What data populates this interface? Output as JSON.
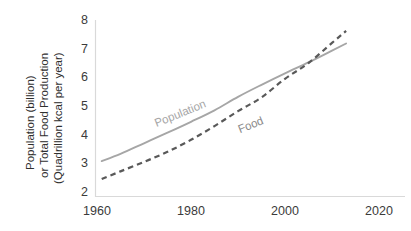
{
  "chart_data": {
    "type": "line",
    "title": "",
    "subtitle": "",
    "xlabel": "",
    "ylabel": "Population (billion) or Total Food Production (Quadrillion kcal per year)",
    "ylabel_lines": [
      "Population (billion)",
      "or Total Food Production",
      "(Quadrillion kcal per year)"
    ],
    "xlim": [
      1958,
      2024
    ],
    "ylim": [
      2,
      8
    ],
    "xticks": [
      1960,
      1980,
      2000,
      2020
    ],
    "yticks": [
      2,
      3,
      4,
      5,
      6,
      7,
      8
    ],
    "xtick_labels": [
      "1960",
      "1980",
      "2000",
      "2020"
    ],
    "ytick_labels": [
      "2",
      "3",
      "4",
      "5",
      "6",
      "7",
      "8"
    ],
    "grid": false,
    "legend_position": "inline-annotation",
    "series": [
      {
        "name": "Population",
        "label": "Population",
        "style": "solid",
        "color": "#a6a6a6",
        "x": [
          1961,
          1965,
          1970,
          1975,
          1980,
          1985,
          1990,
          1995,
          2000,
          2005,
          2010,
          2013
        ],
        "values": [
          3.08,
          3.33,
          3.7,
          4.07,
          4.45,
          4.85,
          5.32,
          5.74,
          6.14,
          6.52,
          6.93,
          7.18
        ]
      },
      {
        "name": "Food",
        "label": "Food",
        "style": "dashed",
        "color": "#595959",
        "x": [
          1961,
          1965,
          1970,
          1975,
          1980,
          1985,
          1990,
          1995,
          2000,
          2005,
          2010,
          2013
        ],
        "values": [
          2.45,
          2.72,
          3.05,
          3.4,
          3.82,
          4.3,
          4.82,
          5.3,
          5.95,
          6.5,
          7.2,
          7.62
        ]
      }
    ],
    "annotations": [
      {
        "text": "Population",
        "x": 1978,
        "y": 4.62,
        "rotation": -22,
        "color": "#a6a6a6"
      },
      {
        "text": "Food",
        "x": 1993,
        "y": 4.22,
        "rotation": -22,
        "color": "#8a8a8a"
      }
    ],
    "axis_color": "#d9d9d9",
    "background_color": "#ffffff"
  }
}
